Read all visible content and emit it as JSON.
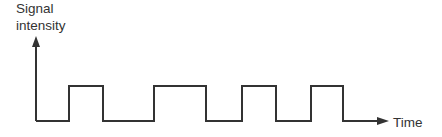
{
  "chart_data": {
    "type": "line",
    "title": "",
    "xlabel": "Time",
    "ylabel": "Signal intensity",
    "ylabel_lines": [
      "Signal",
      "intensity"
    ],
    "grid": false,
    "legend": null,
    "levels": {
      "low": 0,
      "high": 1
    },
    "pulses": [
      {
        "start": 69,
        "end": 103
      },
      {
        "start": 154,
        "end": 206
      },
      {
        "start": 242,
        "end": 276
      },
      {
        "start": 311,
        "end": 343
      }
    ],
    "x_range": [
      36,
      388
    ],
    "series": [
      {
        "name": "signal",
        "x": [
          36,
          69,
          69,
          103,
          103,
          154,
          154,
          206,
          206,
          242,
          242,
          276,
          276,
          311,
          311,
          343,
          343,
          388
        ],
        "values": [
          0,
          0,
          1,
          1,
          0,
          0,
          1,
          1,
          0,
          0,
          1,
          1,
          0,
          0,
          1,
          1,
          0,
          0
        ]
      }
    ]
  },
  "colors": {
    "line": "#333333",
    "text": "#333333",
    "background": "#ffffff"
  }
}
